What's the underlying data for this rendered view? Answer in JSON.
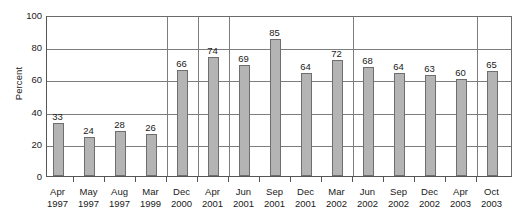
{
  "chart_data": {
    "type": "bar",
    "title": "",
    "xlabel": "",
    "ylabel": "Percent",
    "ylim": [
      0,
      100
    ],
    "yticks": [
      0,
      20,
      40,
      60,
      80,
      100
    ],
    "ytick_labels": [
      "0",
      "20",
      "40",
      "60",
      "80",
      "100"
    ],
    "grid": "horizontal gridlines at every 20 units; sparse vertical separator lines",
    "legend": "none",
    "bar_color": "#b4b4b4",
    "bar_border_color": "#6e6e6e",
    "axis_color": "#555555",
    "categories": [
      "Apr 1997",
      "May 1997",
      "Aug 1997",
      "Mar 1999",
      "Dec 2000",
      "Apr 2001",
      "Jun 2001",
      "Sep 2001",
      "Dec 2001",
      "Mar 2002",
      "Jun 2002",
      "Sep 2002",
      "Dec 2002",
      "Apr 2003",
      "Oct 2003"
    ],
    "category_months": [
      "Apr",
      "May",
      "Aug",
      "Mar",
      "Dec",
      "Apr",
      "Jun",
      "Sep",
      "Dec",
      "Mar",
      "Jun",
      "Sep",
      "Dec",
      "Apr",
      "Oct"
    ],
    "category_years": [
      "1997",
      "1997",
      "1997",
      "1999",
      "2000",
      "2001",
      "2001",
      "2001",
      "2001",
      "2002",
      "2002",
      "2002",
      "2002",
      "2003",
      "2003"
    ],
    "values": [
      33,
      24,
      28,
      26,
      66,
      74,
      69,
      85,
      64,
      72,
      68,
      64,
      63,
      60,
      65
    ],
    "value_labels": [
      "33",
      "24",
      "28",
      "26",
      "66",
      "74",
      "69",
      "85",
      "64",
      "72",
      "68",
      "64",
      "63",
      "60",
      "65"
    ]
  }
}
